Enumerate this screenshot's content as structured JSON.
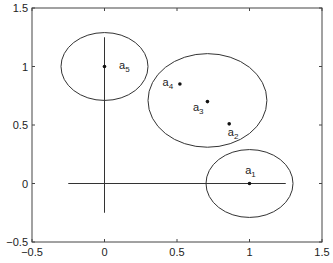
{
  "chart_data": {
    "type": "scatter",
    "title": "",
    "xlabel": "",
    "ylabel": "",
    "xlim": [
      -0.5,
      1.5
    ],
    "ylim": [
      -0.5,
      1.5
    ],
    "grid": false,
    "legend": null,
    "x_ticks": [
      -0.5,
      0,
      0.5,
      1,
      1.5
    ],
    "x_tick_labels": [
      "-0.5",
      "0",
      "0.5",
      "1",
      "1.5"
    ],
    "y_ticks": [
      -0.5,
      0,
      0.5,
      1,
      1.5
    ],
    "y_tick_labels": [
      "-0.5",
      "0",
      "0.5",
      "1",
      "1.5"
    ],
    "points": [
      {
        "label": "a",
        "sub": "1",
        "x": 1.0,
        "y": 0.0,
        "lx": 0.97,
        "ly": 0.08
      },
      {
        "label": "a",
        "sub": "2",
        "x": 0.86,
        "y": 0.51,
        "lx": 0.85,
        "ly": 0.41
      },
      {
        "label": "a",
        "sub": "3",
        "x": 0.71,
        "y": 0.7,
        "lx": 0.61,
        "ly": 0.62
      },
      {
        "label": "a",
        "sub": "4",
        "x": 0.52,
        "y": 0.85,
        "lx": 0.4,
        "ly": 0.83
      },
      {
        "label": "a",
        "sub": "5",
        "x": 0.0,
        "y": 1.0,
        "lx": 0.1,
        "ly": 0.98
      }
    ],
    "ellipses": [
      {
        "name": "cluster-a5",
        "cx": 0.0,
        "cy": 1.0,
        "rx": 0.3,
        "ry": 0.29
      },
      {
        "name": "cluster-a2-a3-a4",
        "cx": 0.71,
        "cy": 0.71,
        "rx": 0.41,
        "ry": 0.4
      },
      {
        "name": "cluster-a1",
        "cx": 1.0,
        "cy": 0.0,
        "rx": 0.3,
        "ry": 0.29
      }
    ],
    "line_segments": [
      {
        "name": "horizontal-axis-line",
        "x1": -0.25,
        "y1": 0.0,
        "x2": 1.25,
        "y2": 0.0
      },
      {
        "name": "vertical-axis-line",
        "x1": 0.0,
        "y1": -0.25,
        "x2": 0.0,
        "y2": 1.25
      }
    ]
  },
  "layout": {
    "plot_left": 32,
    "plot_top": 8,
    "plot_right": 322,
    "plot_bottom": 242,
    "line_color": "#333333",
    "frame_color": "#444444"
  }
}
